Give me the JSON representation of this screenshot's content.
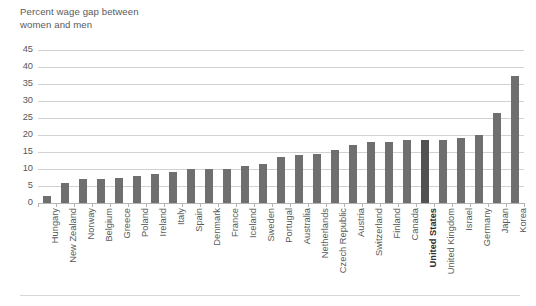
{
  "chart_data": {
    "type": "bar",
    "title": "Percent wage gap between\nwomen and men",
    "xlabel": "",
    "ylabel": "",
    "ylim": [
      0,
      45
    ],
    "ytick_step": 5,
    "yticks": [
      0,
      5,
      10,
      15,
      20,
      25,
      30,
      35,
      40,
      45
    ],
    "grid": true,
    "legend": false,
    "highlight_category": "United States",
    "colors": {
      "bar": "#6f6f6f",
      "bar_highlight": "#525252",
      "gridline": "#d2d2d2",
      "axis": "#b4b4b4",
      "text": "#59595b"
    },
    "categories": [
      "Hungary",
      "New Zealand",
      "Norway",
      "Belgium",
      "Greece",
      "Poland",
      "Ireland",
      "Italy",
      "Spain",
      "Denmark",
      "France",
      "Iceland",
      "Sweden",
      "Portugal",
      "Australia",
      "Netherlands",
      "Czech Republic",
      "Austria",
      "Switzerland",
      "Finland",
      "Canada",
      "United States",
      "United Kingdom",
      "Israel",
      "Germany",
      "Japan",
      "Korea"
    ],
    "values": [
      2,
      6,
      7,
      7,
      7.5,
      8,
      8.5,
      9,
      10,
      10,
      10,
      11,
      11.5,
      13.5,
      14,
      14.5,
      15.5,
      17,
      18,
      18,
      18.5,
      18.5,
      18.5,
      19,
      20,
      26.5,
      37.5
    ]
  }
}
